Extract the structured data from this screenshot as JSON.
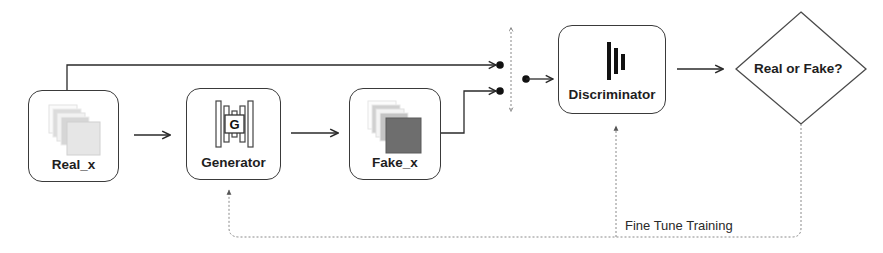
{
  "diagram": {
    "type": "GAN training flow",
    "nodes": {
      "real_x": {
        "label": "Real_x",
        "icon": "image-stack-light-icon"
      },
      "generator": {
        "label": "Generator",
        "icon": "generator-layers-icon",
        "icon_letter": "G"
      },
      "fake_x": {
        "label": "Fake_x",
        "icon": "image-stack-dark-icon"
      },
      "discriminator": {
        "label": "Discriminator",
        "icon": "discriminator-bars-icon"
      },
      "decision": {
        "label": "Real or Fake?",
        "shape": "diamond"
      }
    },
    "edges": [
      {
        "from": "real_x",
        "to": "generator",
        "style": "solid"
      },
      {
        "from": "generator",
        "to": "fake_x",
        "style": "solid"
      },
      {
        "from": "real_x",
        "to": "switch-input-top",
        "style": "solid"
      },
      {
        "from": "fake_x",
        "to": "switch-input-bottom",
        "style": "solid"
      },
      {
        "from": "switch-output",
        "to": "discriminator",
        "style": "solid"
      },
      {
        "from": "discriminator",
        "to": "decision",
        "style": "solid"
      },
      {
        "from": "decision",
        "to": "generator",
        "style": "dashed",
        "label": "Fine Tune Training"
      },
      {
        "from": "decision",
        "to": "discriminator",
        "style": "dashed"
      }
    ],
    "feedback_label": "Fine Tune Training"
  },
  "colors": {
    "stroke": "#3a3a3a",
    "dashed": "#8a8a8a",
    "fake_square": "#6e6e6e",
    "real_square": "#e4e4e4"
  }
}
